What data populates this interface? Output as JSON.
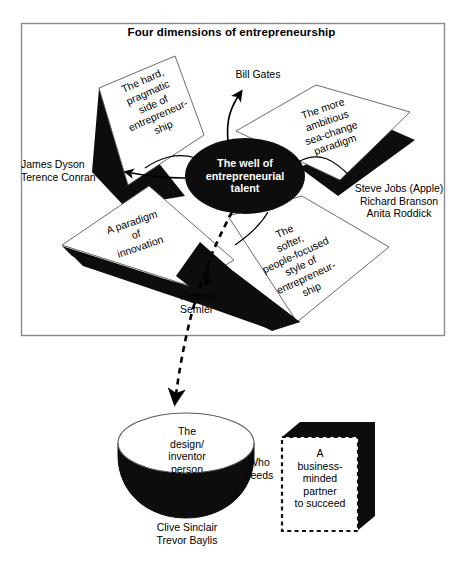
{
  "diagram": {
    "title": "Four dimensions of entrepreneurship",
    "center": {
      "label": "The well of\nentrepreneurial\ntalent"
    },
    "quadrants": [
      {
        "id": "top-left",
        "label": "The hard,\npragmatic\nside of\nentrepreneur-\nship",
        "examples": "James Dyson\nTerence Conran"
      },
      {
        "id": "top-right",
        "label": "The more\nambitious\nsea-change\nparadigm",
        "examples": "Steve Jobs (Apple)\nRichard Branson\nAnita Roddick"
      },
      {
        "id": "bottom-left",
        "label": "A paradigm\nof\ninnovation",
        "examples": "Ricardo\nSemler"
      },
      {
        "id": "bottom-right",
        "label": "The\nsofter,\npeople-focused\nstyle of\nentrepreneur-\nship",
        "examples": ""
      }
    ],
    "pointers": [
      {
        "id": "bill-gates",
        "text": "Bill Gates"
      },
      {
        "id": "james-dyson",
        "text": "James Dyson\nTerence Conran"
      },
      {
        "id": "steve-jobs",
        "text": "Steve Jobs (Apple)\nRichard Branson\nAnita Roddick"
      },
      {
        "id": "ricardo-semler",
        "text": "Ricardo\nSemler"
      }
    ],
    "bottom": {
      "cylinder_label": "The\ndesign/\ninventor\nperson",
      "cylinder_examples": "Clive Sinclair\nTrevor Baylis",
      "connector_label": "Who\nneeds",
      "cube_label": "A\nbusiness-\nminded\npartner\nto succeed"
    },
    "colors": {
      "ink": "#000000",
      "frame": "#808080",
      "paper": "#ffffff",
      "solid_fill": "#111111"
    }
  }
}
